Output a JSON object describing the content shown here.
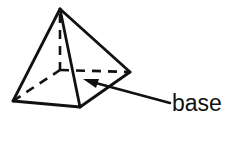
{
  "diagram": {
    "shape_name": "square-pyramid",
    "background_color": "#ffffff",
    "stroke_color": "#111111",
    "base_fill_color": "#c8c8c8",
    "face_fill_color": "#ffffff",
    "stroke_width": 2.6,
    "hidden_edge_style": "dashed",
    "vertices": {
      "apex": [
        60,
        9
      ],
      "base_front": [
        80,
        107
      ],
      "base_left": [
        13,
        101
      ],
      "base_right": [
        130,
        72
      ],
      "base_back_hidden": [
        60,
        70
      ]
    },
    "solid_edges": [
      "apex-to-base-left",
      "apex-to-base-front",
      "apex-to-base-right",
      "base-left-to-base-front",
      "base-front-to-base-right"
    ],
    "hidden_edges": [
      "base-left-to-base-back",
      "base-back-to-base-right",
      "apex-to-base-back-altitude"
    ],
    "callout": {
      "label": "base",
      "arrow_tail": [
        170,
        103
      ],
      "arrow_tip": [
        84,
        80
      ],
      "arrowhead": "solid-triangle",
      "points_to": "base-face"
    }
  }
}
